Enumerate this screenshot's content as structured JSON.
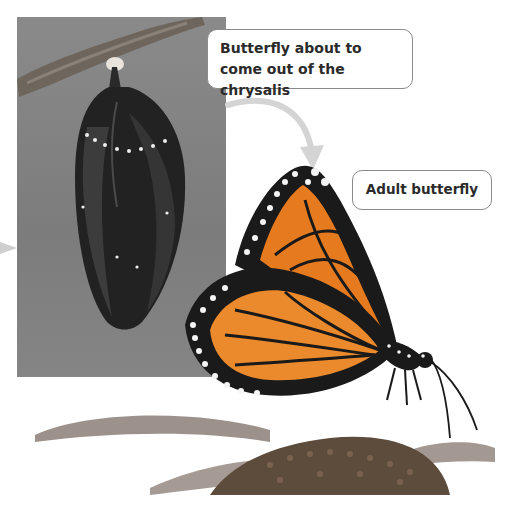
{
  "figure": {
    "callouts": [
      {
        "label": "Butterfly about to come out of the chrysalis"
      },
      {
        "label": "Adult butterfly"
      }
    ],
    "colors": {
      "photo_background": "#808080",
      "callout_border": "#8a8a8a",
      "arrow": "#cfcfcf",
      "wing_orange": "#e57a1e",
      "wing_black": "#1a1a1a",
      "flower_center": "#5a4a3a",
      "petal": "#9a8e88"
    }
  }
}
